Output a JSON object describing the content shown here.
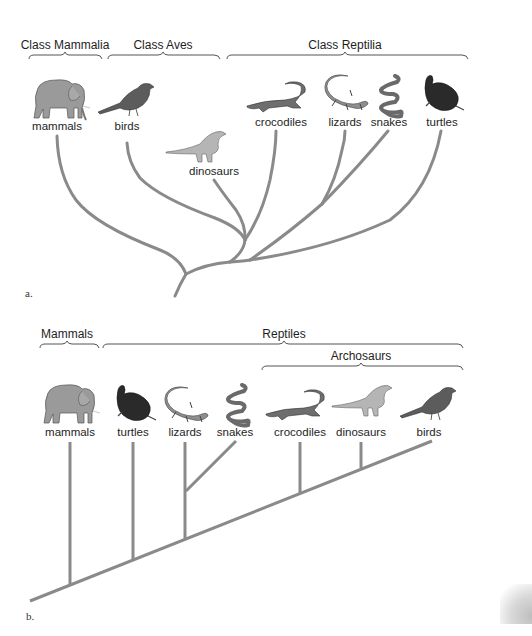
{
  "panel_a": {
    "tag": "a.",
    "groups": [
      {
        "label": "Class Mammalia",
        "x": 65
      },
      {
        "label": "Class Aves",
        "x": 163
      },
      {
        "label": "Class Reptilia",
        "x": 345
      }
    ],
    "taxa": [
      {
        "label": "mammals",
        "icon": "elephant-icon",
        "x": 57
      },
      {
        "label": "birds",
        "icon": "bird-icon",
        "x": 127
      },
      {
        "label": "dinosaurs",
        "icon": "dinosaur-icon",
        "x": 214
      },
      {
        "label": "crocodiles",
        "icon": "crocodile-icon",
        "x": 281
      },
      {
        "label": "lizards",
        "icon": "lizard-icon",
        "x": 345
      },
      {
        "label": "snakes",
        "icon": "snake-icon",
        "x": 389
      },
      {
        "label": "turtles",
        "icon": "turtle-icon",
        "x": 442
      }
    ]
  },
  "panel_b": {
    "tag": "b.",
    "groups": [
      {
        "label": "Mammals",
        "x": 67
      },
      {
        "label": "Reptiles",
        "x": 284
      },
      {
        "label": "Archosaurs",
        "x": 361
      }
    ],
    "taxa": [
      {
        "label": "mammals",
        "icon": "elephant-icon",
        "x": 70
      },
      {
        "label": "turtles",
        "icon": "turtle-icon",
        "x": 133
      },
      {
        "label": "lizards",
        "icon": "lizard-icon",
        "x": 185
      },
      {
        "label": "snakes",
        "icon": "snake-icon",
        "x": 235
      },
      {
        "label": "crocodiles",
        "icon": "crocodile-icon",
        "x": 300
      },
      {
        "label": "dinosaurs",
        "icon": "dinosaur-icon",
        "x": 361
      },
      {
        "label": "birds",
        "icon": "bird-icon",
        "x": 429
      }
    ]
  },
  "colors": {
    "branch": "#8a8a8a",
    "bracket": "#555555",
    "elephant": "#9a9a9a",
    "bird": "#5c5c5c",
    "dino": "#b5b5b5",
    "croc": "#6e6e6e",
    "lizard": "#8e8e8e",
    "snake": "#6a6a6a",
    "turtle": "#2a2a2a"
  }
}
